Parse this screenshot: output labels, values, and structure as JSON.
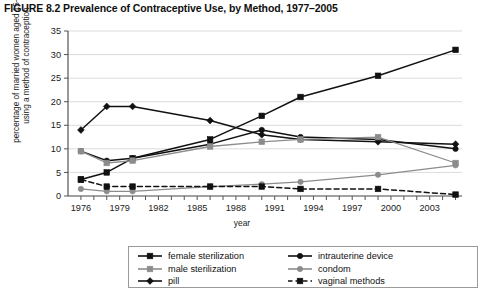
{
  "figure": {
    "title": "FIGURE 8.2 Prevalence of Contraceptive Use, by Method, 1977–2005"
  },
  "axes": {
    "ylabel": "percentage of married women aged 15–49 using a method of contraception",
    "xlabel": "year",
    "y_ticks": [
      "0",
      "5",
      "10",
      "15",
      "20",
      "25",
      "30",
      "35"
    ],
    "x_ticks_labeled": [
      "1976",
      "1979",
      "1982",
      "1985",
      "1988",
      "1991",
      "1994",
      "1997",
      "2000",
      "2003"
    ]
  },
  "legend": {
    "entries": [
      {
        "label": "female sterilization",
        "marker": "square",
        "color": "#111111",
        "dash": "solid"
      },
      {
        "label": "intrauterine device",
        "marker": "circle",
        "color": "#111111",
        "dash": "solid"
      },
      {
        "label": "male sterilization",
        "marker": "square",
        "color": "#8c8c8c",
        "dash": "solid"
      },
      {
        "label": "condom",
        "marker": "circle",
        "color": "#8c8c8c",
        "dash": "solid"
      },
      {
        "label": "pill",
        "marker": "diamond",
        "color": "#111111",
        "dash": "solid"
      },
      {
        "label": "vaginal methods",
        "marker": "square",
        "color": "#111111",
        "dash": "dashed"
      }
    ]
  },
  "chart_data": {
    "type": "line",
    "title": "FIGURE 8.2 Prevalence of Contraceptive Use, by Method, 1977–2005",
    "xlabel": "year",
    "ylabel": "percentage of married women aged 15–49 using a method of contraception",
    "xlim": [
      1975,
      2005.5
    ],
    "ylim": [
      0,
      35
    ],
    "ytick_step": 5,
    "xtick_step": 1,
    "xtick_label_step": 3,
    "grid": "horizontal",
    "legend_position": "bottom",
    "x": [
      1976,
      1978,
      1980,
      1986,
      1990,
      1993,
      1999,
      2005
    ],
    "series": [
      {
        "name": "female sterilization",
        "marker": "square",
        "color": "#111111",
        "dash": "solid",
        "values": [
          3.5,
          5.0,
          8.0,
          12.0,
          17.0,
          21.0,
          25.5,
          31.0
        ]
      },
      {
        "name": "pill",
        "marker": "diamond",
        "color": "#111111",
        "dash": "solid",
        "values": [
          14.0,
          19.0,
          19.0,
          16.0,
          13.0,
          12.0,
          11.5,
          11.0
        ]
      },
      {
        "name": "intrauterine device",
        "marker": "circle",
        "color": "#111111",
        "dash": "solid",
        "values": [
          9.5,
          7.5,
          8.0,
          11.0,
          14.0,
          12.5,
          12.0,
          10.0
        ]
      },
      {
        "name": "male sterilization",
        "marker": "square",
        "color": "#8c8c8c",
        "dash": "solid",
        "values": [
          9.5,
          7.0,
          7.5,
          10.5,
          11.5,
          12.0,
          12.5,
          7.0
        ]
      },
      {
        "name": "condom",
        "marker": "circle",
        "color": "#8c8c8c",
        "dash": "solid",
        "values": [
          1.5,
          1.0,
          1.0,
          2.0,
          2.5,
          3.0,
          4.5,
          6.5
        ]
      },
      {
        "name": "vaginal methods",
        "marker": "square",
        "color": "#111111",
        "dash": "dashed",
        "values": [
          3.5,
          2.0,
          2.0,
          2.0,
          2.0,
          1.5,
          1.5,
          0.3
        ]
      }
    ]
  }
}
